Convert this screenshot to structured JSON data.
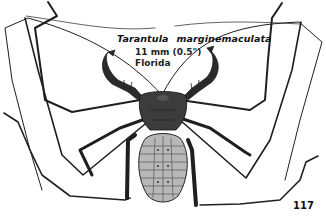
{
  "figure": {
    "caption": {
      "genus": "Tarantula",
      "species": "marginemaculata",
      "size": "11 mm (0.5\")",
      "locality": "Florida"
    },
    "page_number": "117"
  },
  "colors": {
    "background": "#ffffff",
    "ink": "#1a1a1a",
    "body_dark": "#3a3a3a",
    "abdomen_light": "#b8b8b8"
  }
}
